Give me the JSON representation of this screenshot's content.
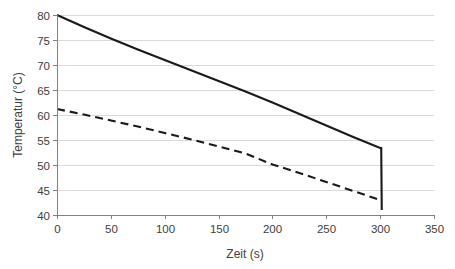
{
  "chart_data": {
    "type": "line",
    "title": "",
    "subtitle": "",
    "xlabel": "Zeit (s)",
    "ylabel": "Temperatur (°C)",
    "xlim": [
      0,
      350
    ],
    "ylim": [
      40,
      80
    ],
    "xticks": [
      0,
      50,
      100,
      150,
      200,
      250,
      300,
      350
    ],
    "yticks": [
      40,
      45,
      50,
      55,
      60,
      65,
      70,
      75,
      80
    ],
    "xtick_labels": [
      "0",
      "50",
      "100",
      "150",
      "200",
      "250",
      "300",
      "350"
    ],
    "ytick_labels": [
      "40",
      "45",
      "50",
      "55",
      "60",
      "65",
      "70",
      "75",
      "80"
    ],
    "grid": "horizontal",
    "legend": "none",
    "background": "#ffffff",
    "gridline_color": "#d9d9d9",
    "axis_color": "#808080",
    "series": [
      {
        "name": "solid-curve",
        "style": "solid",
        "color": "#1a1a1a",
        "x": [
          0,
          25,
          50,
          75,
          100,
          125,
          150,
          175,
          200,
          225,
          250,
          275,
          300,
          301,
          301.5
        ],
        "values": [
          80.0,
          77.6,
          75.3,
          73.1,
          71.0,
          68.9,
          66.8,
          64.7,
          62.5,
          60.2,
          57.9,
          55.6,
          53.4,
          53.4,
          41.0
        ]
      },
      {
        "name": "dashed-curve",
        "style": "dashed",
        "color": "#1a1a1a",
        "x": [
          0,
          25,
          50,
          75,
          100,
          125,
          150,
          175,
          200,
          225,
          250,
          275,
          300
        ],
        "values": [
          61.2,
          60.1,
          58.9,
          57.7,
          56.4,
          55.1,
          53.7,
          52.3,
          50.1,
          48.4,
          46.6,
          44.8,
          43.0
        ]
      }
    ]
  },
  "geometry": {
    "plot_left": 57,
    "plot_right": 434,
    "plot_top": 15,
    "plot_bottom": 215
  }
}
